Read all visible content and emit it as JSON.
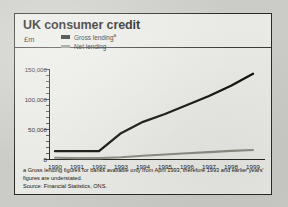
{
  "figure": {
    "title": "UK consumer credit",
    "units": "£m",
    "footnote_a": "a Gross lending figures for banks available only from April 1993, therefore 1993 and earlier years' figures are understated.",
    "source": "Source: Financial Statistics, ONS."
  },
  "colors": {
    "gross_lending": "#16160f",
    "net_lending": "#8d8d86",
    "axis": "#26261f",
    "panel_background": "#e9e9e5",
    "page_background": "#cbcbc7"
  },
  "chart_data": {
    "type": "line",
    "title": "UK consumer credit",
    "subtitle": "£m",
    "xlabel": "",
    "ylabel": "£m",
    "x": [
      1990,
      1991,
      1992,
      1993,
      1994,
      1995,
      1996,
      1997,
      1998,
      1999
    ],
    "categories": [
      "1990",
      "1991",
      "1992",
      "1993",
      "1994",
      "1995",
      "1996",
      "1997",
      "1998",
      "1999"
    ],
    "ylim": [
      0,
      150000
    ],
    "yticks": [
      0,
      50000,
      100000,
      150000
    ],
    "ytick_labels": [
      "0",
      "50,000",
      "100,000",
      "150,000"
    ],
    "minor_ticks": true,
    "grid": false,
    "legend_position": "top-left",
    "series": [
      {
        "name": "Gross lending",
        "footnote_marker": "a",
        "color": "#16160f",
        "values": [
          13000,
          13000,
          13000,
          43000,
          62000,
          75000,
          90000,
          105000,
          122000,
          142000
        ]
      },
      {
        "name": "Net lending",
        "color": "#8d8d86",
        "values": [
          2000,
          1500,
          1500,
          3000,
          5500,
          7500,
          9500,
          11500,
          13500,
          15000
        ]
      }
    ],
    "annotations": [
      "a Gross lending figures for banks available only from April 1993, therefore 1993 and earlier years' figures are understated.",
      "Source: Financial Statistics, ONS."
    ]
  }
}
